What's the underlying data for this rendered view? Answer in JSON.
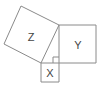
{
  "diagram": {
    "type": "pythagorean-squares",
    "colors": {
      "stroke": "#8a8a8a",
      "label": "#444444",
      "background": "#ffffff"
    },
    "squares": [
      {
        "id": "Z",
        "label": "Z",
        "points": "21,6 59,25 41,63 4,44",
        "label_pos": [
          31,
          37
        ]
      },
      {
        "id": "Y",
        "label": "Y",
        "points": "59,25 96,25 96,63 59,63",
        "label_pos": [
          78,
          45
        ]
      },
      {
        "id": "X",
        "label": "X",
        "points": "41,63 59,63 59,82 41,82",
        "label_pos": [
          50,
          73
        ]
      }
    ],
    "right_angle_marker": {
      "points": "53,63 53,57 59,57"
    }
  }
}
